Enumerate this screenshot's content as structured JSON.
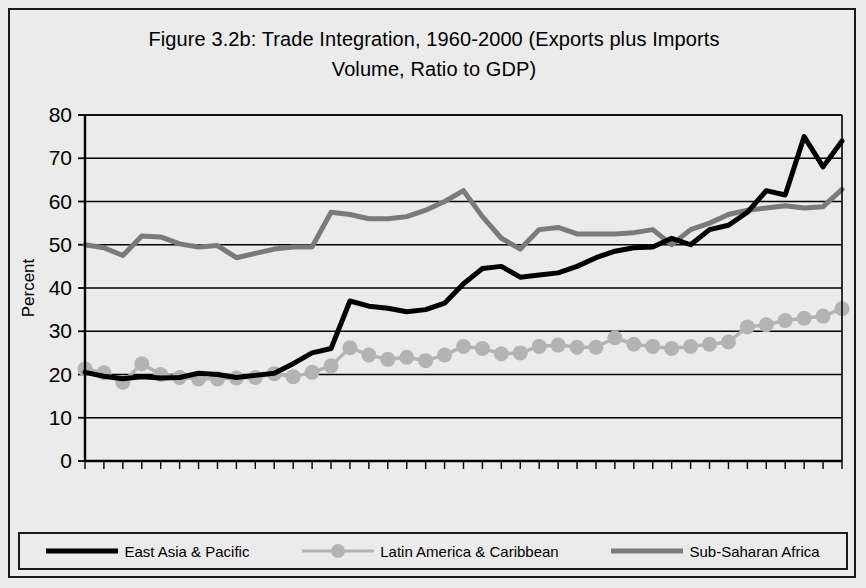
{
  "figure": {
    "title_line1": "Figure 3.2b: Trade Integration, 1960-2000 (Exports plus Imports",
    "title_line2": "Volume, Ratio to GDP)"
  },
  "legend": {
    "items": [
      {
        "label": "East Asia & Pacific",
        "color": "#000000",
        "marker": "none",
        "line_width": 5
      },
      {
        "label": "Latin America & Caribbean",
        "color": "#b3b3b3",
        "marker": "circle",
        "line_width": 3
      },
      {
        "label": "Sub-Saharan Africa",
        "color": "#7a7a7a",
        "marker": "none",
        "line_width": 5
      }
    ]
  },
  "chart_data": {
    "type": "line",
    "title": "Figure 3.2b: Trade Integration, 1960-2000 (Exports plus Imports Volume, Ratio to GDP)",
    "xlabel": "Year",
    "ylabel": "Percent",
    "xlim": [
      1960,
      2000
    ],
    "ylim": [
      0,
      80
    ],
    "ytick_step": 10,
    "xtick_label_step": 5,
    "xtick_minor_step": 1,
    "grid": "horizontal",
    "legend_position": "bottom",
    "yticks": [
      0,
      10,
      20,
      30,
      40,
      50,
      60,
      70,
      80
    ],
    "xticks": [
      1960,
      1965,
      1970,
      1975,
      1980,
      1985,
      1990,
      1995,
      2000
    ],
    "x": [
      1960,
      1961,
      1962,
      1963,
      1964,
      1965,
      1966,
      1967,
      1968,
      1969,
      1970,
      1971,
      1972,
      1973,
      1974,
      1975,
      1976,
      1977,
      1978,
      1979,
      1980,
      1981,
      1982,
      1983,
      1984,
      1985,
      1986,
      1987,
      1988,
      1989,
      1990,
      1991,
      1992,
      1993,
      1994,
      1995,
      1996,
      1997,
      1998,
      1999,
      2000
    ],
    "series": [
      {
        "name": "East Asia & Pacific",
        "color": "#000000",
        "marker": "none",
        "values": [
          20.5,
          19.6,
          19.0,
          19.5,
          19.2,
          19.3,
          20.3,
          20.0,
          19.3,
          19.8,
          20.3,
          22.5,
          25.0,
          26.0,
          37.0,
          35.8,
          35.3,
          34.5,
          35.0,
          36.5,
          41.0,
          44.5,
          45.0,
          42.5,
          43.0,
          43.5,
          45.0,
          47.0,
          48.5,
          49.3,
          49.5,
          51.5,
          50.0,
          53.5,
          54.5,
          57.5,
          62.5,
          61.5,
          75.0,
          68.0,
          74.0
        ]
      },
      {
        "name": "Latin America & Caribbean",
        "color": "#b3b3b3",
        "marker": "circle",
        "values": [
          21.3,
          20.4,
          18.2,
          22.5,
          20.0,
          19.3,
          19.0,
          19.0,
          19.2,
          19.3,
          20.2,
          19.5,
          20.5,
          22.0,
          26.2,
          24.5,
          23.5,
          24.0,
          23.2,
          24.5,
          26.5,
          26.0,
          24.8,
          25.0,
          26.5,
          26.8,
          26.3,
          26.3,
          28.5,
          27.0,
          26.5,
          26.0,
          26.5,
          27.0,
          27.5,
          31.0,
          31.5,
          32.5,
          33.0,
          33.5,
          35.2
        ]
      },
      {
        "name": "Sub-Saharan Africa",
        "color": "#7a7a7a",
        "marker": "none",
        "values": [
          50.0,
          49.3,
          47.5,
          52.0,
          51.8,
          50.2,
          49.5,
          49.8,
          47.0,
          48.0,
          49.0,
          49.5,
          49.5,
          57.5,
          57.0,
          56.0,
          56.0,
          56.5,
          58.0,
          60.0,
          62.5,
          56.5,
          51.5,
          49.0,
          53.5,
          54.0,
          52.5,
          52.5,
          52.5,
          52.8,
          53.5,
          50.0,
          53.5,
          55.0,
          57.0,
          58.0,
          58.5,
          59.0,
          58.5,
          58.8,
          62.8
        ]
      }
    ]
  }
}
